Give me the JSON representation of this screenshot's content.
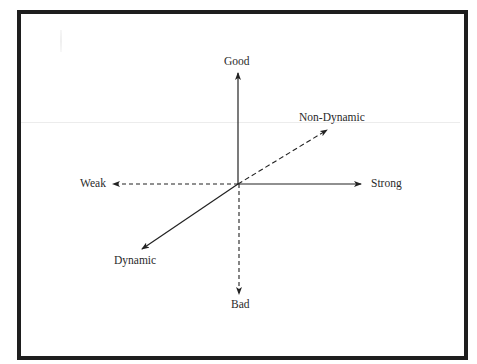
{
  "diagram": {
    "type": "axis-cross",
    "center": {
      "x": 238,
      "y": 184
    },
    "axes": [
      {
        "id": "good",
        "label": "Good",
        "direction": "up",
        "style": "solid"
      },
      {
        "id": "bad",
        "label": "Bad",
        "direction": "down",
        "style": "dashed"
      },
      {
        "id": "strong",
        "label": "Strong",
        "direction": "right",
        "style": "solid"
      },
      {
        "id": "weak",
        "label": "Weak",
        "direction": "left",
        "style": "dashed"
      },
      {
        "id": "non_dynamic",
        "label": "Non-Dynamic",
        "direction": "up-right",
        "style": "dashed"
      },
      {
        "id": "dynamic",
        "label": "Dynamic",
        "direction": "down-left",
        "style": "solid"
      }
    ],
    "colors": {
      "frame": "#1e1e1e",
      "lines": "#222222",
      "text": "#2a2a2a",
      "background": "#ffffff"
    }
  },
  "labels": {
    "good": "Good",
    "bad": "Bad",
    "strong": "Strong",
    "weak": "Weak",
    "non_dynamic": "Non-Dynamic",
    "dynamic": "Dynamic"
  }
}
